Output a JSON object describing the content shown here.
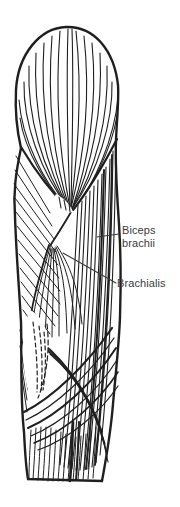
{
  "figure": {
    "background": "#ffffff",
    "ink_color": "#1f1f1f",
    "label_color": "#3b3b3b",
    "labels": {
      "biceps_brachii": {
        "line1": "Biceps",
        "line2": "brachii"
      },
      "brachialis": {
        "text": "Brachialis"
      }
    }
  }
}
